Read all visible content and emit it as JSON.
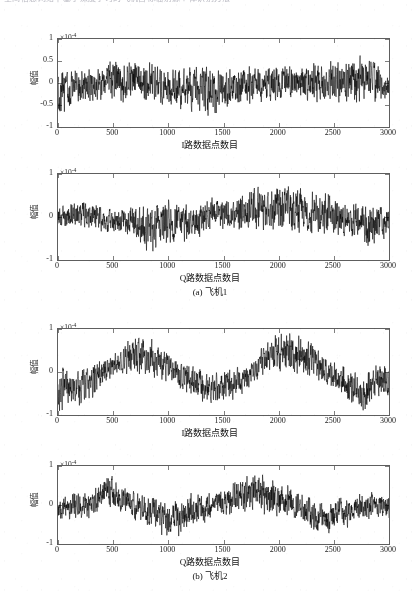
{
  "page": {
    "cut_off_header": "空间信息网络中基于深度学习的飞机目标辐射源个体识别方法",
    "background": "#ffffff",
    "ink": "#1a1a1a"
  },
  "figure": {
    "multiplier_label": "×10",
    "multiplier_exponent": "-4",
    "y_axis_title": "幅值",
    "subcaptions": [
      "(a) 飞机1",
      "(b) 飞机2"
    ]
  },
  "chart_data": [
    {
      "type": "line",
      "panel": "1",
      "title": "",
      "xlabel": "I路数据点数目",
      "ylabel": "幅值",
      "y_multiplier": "×10^-4",
      "xlim": [
        0,
        3000
      ],
      "ylim": [
        -1,
        1
      ],
      "xticks": [
        0,
        500,
        1000,
        1500,
        2000,
        2500,
        3000
      ],
      "yticks": [
        1,
        0.5,
        0,
        -0.5,
        -1
      ],
      "ytick_labels": [
        "1",
        "0.5",
        "0",
        "-0.5",
        "-1"
      ],
      "grid": false,
      "legend": null,
      "line_color": "#000000",
      "series": [
        {
          "name": "I channel aircraft 1",
          "description": "dense zero-mean noise-like waveform, envelope roughly ±0.55e-4 with occasional excursions to ±0.8e-4",
          "envelope": [
            {
              "x": 0,
              "lo": -0.78,
              "hi": 0.3
            },
            {
              "x": 150,
              "lo": -0.62,
              "hi": 0.42
            },
            {
              "x": 300,
              "lo": -0.48,
              "hi": 0.4
            },
            {
              "x": 500,
              "lo": -0.46,
              "hi": 0.62
            },
            {
              "x": 650,
              "lo": -0.5,
              "hi": 0.66
            },
            {
              "x": 800,
              "lo": -0.52,
              "hi": 0.52
            },
            {
              "x": 1000,
              "lo": -0.56,
              "hi": 0.4
            },
            {
              "x": 1200,
              "lo": -0.7,
              "hi": 0.42
            },
            {
              "x": 1350,
              "lo": -0.92,
              "hi": 0.52
            },
            {
              "x": 1500,
              "lo": -0.6,
              "hi": 0.36
            },
            {
              "x": 1700,
              "lo": -0.54,
              "hi": 0.42
            },
            {
              "x": 1900,
              "lo": -0.5,
              "hi": 0.46
            },
            {
              "x": 2100,
              "lo": -0.52,
              "hi": 0.5
            },
            {
              "x": 2300,
              "lo": -0.5,
              "hi": 0.52
            },
            {
              "x": 2500,
              "lo": -0.48,
              "hi": 0.56
            },
            {
              "x": 2700,
              "lo": -0.5,
              "hi": 0.68
            },
            {
              "x": 2850,
              "lo": -0.54,
              "hi": 0.62
            },
            {
              "x": 3000,
              "lo": -0.46,
              "hi": 0.34
            }
          ]
        }
      ]
    },
    {
      "type": "line",
      "panel": "2",
      "title": "",
      "xlabel": "Q路数据点数目",
      "ylabel": "幅值",
      "y_multiplier": "×10^-4",
      "xlim": [
        0,
        3000
      ],
      "ylim": [
        -1,
        1
      ],
      "xticks": [
        0,
        500,
        1000,
        1500,
        2000,
        2500,
        3000
      ],
      "yticks": [
        1,
        0,
        -1
      ],
      "ytick_labels": [
        "1",
        "0",
        "-1"
      ],
      "grid": false,
      "legend": null,
      "line_color": "#000000",
      "series": [
        {
          "name": "Q channel aircraft 1",
          "description": "zero-mean noise-like waveform, envelope ±0.45e-4 early, growing to ±0.85e-4 near x=1800-2100",
          "envelope": [
            {
              "x": 0,
              "lo": -0.4,
              "hi": 0.34
            },
            {
              "x": 200,
              "lo": -0.34,
              "hi": 0.44
            },
            {
              "x": 400,
              "lo": -0.42,
              "hi": 0.3
            },
            {
              "x": 600,
              "lo": -0.5,
              "hi": 0.26
            },
            {
              "x": 800,
              "lo": -0.86,
              "hi": 0.28
            },
            {
              "x": 1000,
              "lo": -0.8,
              "hi": 0.52
            },
            {
              "x": 1200,
              "lo": -0.58,
              "hi": 0.3
            },
            {
              "x": 1400,
              "lo": -0.44,
              "hi": 0.52
            },
            {
              "x": 1600,
              "lo": -0.4,
              "hi": 0.48
            },
            {
              "x": 1780,
              "lo": -0.42,
              "hi": 0.88
            },
            {
              "x": 1950,
              "lo": -0.44,
              "hi": 0.7
            },
            {
              "x": 2080,
              "lo": -0.4,
              "hi": 0.92
            },
            {
              "x": 2250,
              "lo": -0.42,
              "hi": 0.66
            },
            {
              "x": 2450,
              "lo": -0.44,
              "hi": 0.58
            },
            {
              "x": 2650,
              "lo": -0.52,
              "hi": 0.4
            },
            {
              "x": 2850,
              "lo": -0.78,
              "hi": 0.34
            },
            {
              "x": 3000,
              "lo": -0.46,
              "hi": 0.3
            }
          ]
        }
      ]
    },
    {
      "type": "line",
      "panel": "3",
      "title": "",
      "xlabel": "I路数据点数目",
      "ylabel": "幅值",
      "y_multiplier": "×10^-4",
      "xlim": [
        0,
        3000
      ],
      "ylim": [
        -1,
        1
      ],
      "xticks": [
        0,
        500,
        1000,
        1500,
        2000,
        2500,
        3000
      ],
      "yticks": [
        1,
        0,
        -1
      ],
      "ytick_labels": [
        "1",
        "0",
        "-1"
      ],
      "grid": false,
      "legend": null,
      "line_color": "#000000",
      "series": [
        {
          "name": "I channel aircraft 2",
          "description": "slow large-scale modulation: dips near x=0-250 and 1200-1600 and 2700-2900, crests near 600-850 and 1900-2350",
          "envelope": [
            {
              "x": 0,
              "lo": -1.0,
              "hi": 0.18
            },
            {
              "x": 120,
              "lo": -0.82,
              "hi": 0.1
            },
            {
              "x": 250,
              "lo": -0.92,
              "hi": 0.16
            },
            {
              "x": 400,
              "lo": -0.34,
              "hi": 0.32
            },
            {
              "x": 550,
              "lo": -0.12,
              "hi": 0.56
            },
            {
              "x": 700,
              "lo": -0.08,
              "hi": 0.96
            },
            {
              "x": 850,
              "lo": -0.22,
              "hi": 0.8
            },
            {
              "x": 1000,
              "lo": -0.3,
              "hi": 0.52
            },
            {
              "x": 1150,
              "lo": -0.52,
              "hi": 0.24
            },
            {
              "x": 1300,
              "lo": -0.74,
              "hi": 0.1
            },
            {
              "x": 1450,
              "lo": -0.8,
              "hi": 0.12
            },
            {
              "x": 1600,
              "lo": -0.7,
              "hi": 0.14
            },
            {
              "x": 1750,
              "lo": -0.42,
              "hi": 0.3
            },
            {
              "x": 1900,
              "lo": -0.14,
              "hi": 0.78
            },
            {
              "x": 2050,
              "lo": -0.06,
              "hi": 1.0
            },
            {
              "x": 2200,
              "lo": -0.18,
              "hi": 0.86
            },
            {
              "x": 2350,
              "lo": -0.26,
              "hi": 0.72
            },
            {
              "x": 2500,
              "lo": -0.4,
              "hi": 0.28
            },
            {
              "x": 2700,
              "lo": -0.88,
              "hi": 0.06
            },
            {
              "x": 2800,
              "lo": -1.0,
              "hi": 0.04
            },
            {
              "x": 2900,
              "lo": -0.6,
              "hi": 0.28
            },
            {
              "x": 3000,
              "lo": -0.7,
              "hi": 0.26
            }
          ]
        }
      ]
    },
    {
      "type": "line",
      "panel": "4",
      "title": "",
      "xlabel": "Q路数据点数目",
      "ylabel": "幅值",
      "y_multiplier": "×10^-4",
      "xlim": [
        0,
        3000
      ],
      "ylim": [
        -1,
        1
      ],
      "xticks": [
        0,
        500,
        1000,
        1500,
        2000,
        2500,
        3000
      ],
      "yticks": [
        1,
        0,
        -1
      ],
      "ytick_labels": [
        "1",
        "0",
        "-1"
      ],
      "grid": false,
      "legend": null,
      "line_color": "#000000",
      "series": [
        {
          "name": "Q channel aircraft 2",
          "description": "peak burst near x=450-520 reaching 1.0e-4, broad active band 1600-2100, deep troughs near 900-1050 and 2350-2500",
          "envelope": [
            {
              "x": 0,
              "lo": -0.46,
              "hi": 0.2
            },
            {
              "x": 150,
              "lo": -0.44,
              "hi": 0.42
            },
            {
              "x": 300,
              "lo": -0.4,
              "hi": 0.34
            },
            {
              "x": 450,
              "lo": -0.22,
              "hi": 1.0
            },
            {
              "x": 560,
              "lo": -0.26,
              "hi": 0.72
            },
            {
              "x": 700,
              "lo": -0.44,
              "hi": 0.4
            },
            {
              "x": 850,
              "lo": -0.68,
              "hi": 0.26
            },
            {
              "x": 980,
              "lo": -0.96,
              "hi": 0.18
            },
            {
              "x": 1100,
              "lo": -0.88,
              "hi": 0.34
            },
            {
              "x": 1250,
              "lo": -0.58,
              "hi": 0.4
            },
            {
              "x": 1400,
              "lo": -0.4,
              "hi": 0.34
            },
            {
              "x": 1550,
              "lo": -0.34,
              "hi": 0.56
            },
            {
              "x": 1700,
              "lo": -0.3,
              "hi": 0.82
            },
            {
              "x": 1850,
              "lo": -0.34,
              "hi": 0.92
            },
            {
              "x": 2000,
              "lo": -0.36,
              "hi": 0.78
            },
            {
              "x": 2150,
              "lo": -0.42,
              "hi": 0.44
            },
            {
              "x": 2300,
              "lo": -0.74,
              "hi": 0.26
            },
            {
              "x": 2450,
              "lo": -0.96,
              "hi": 0.18
            },
            {
              "x": 2600,
              "lo": -0.66,
              "hi": 0.28
            },
            {
              "x": 2750,
              "lo": -0.48,
              "hi": 0.34
            },
            {
              "x": 2900,
              "lo": -0.36,
              "hi": 0.4
            },
            {
              "x": 3000,
              "lo": -0.42,
              "hi": 0.3
            }
          ]
        }
      ]
    }
  ]
}
